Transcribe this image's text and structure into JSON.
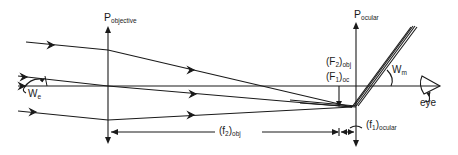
{
  "diagram": {
    "title": "",
    "colors": {
      "line": "#1a1a1a",
      "background": "#ffffff"
    },
    "labels": {
      "p_objective": {
        "main": "P",
        "sub": "objective"
      },
      "p_ocular": {
        "main": "P",
        "sub": "ocular"
      },
      "f2_obj_focus": {
        "main": "(F",
        "idx": "2",
        "close": ")",
        "sub": "obj"
      },
      "f1_oc_focus": {
        "main": "(F",
        "idx": "1",
        "close": ")",
        "sub": "oc"
      },
      "w_m": {
        "main": "W",
        "sub": "m"
      },
      "w_e": {
        "main": "W",
        "sub": "e"
      },
      "eye": "eye",
      "f2_obj_length": {
        "main": "(f",
        "idx": "2",
        "close": ")",
        "sub": "obj"
      },
      "f1_ocular_length": {
        "main": "(f",
        "idx": "1",
        "close": ")",
        "sub": "ocular"
      }
    },
    "elements": [
      "objective lens plane",
      "ocular lens plane",
      "optical axis",
      "incoming rays",
      "beam splitter/mirror",
      "eye"
    ]
  }
}
